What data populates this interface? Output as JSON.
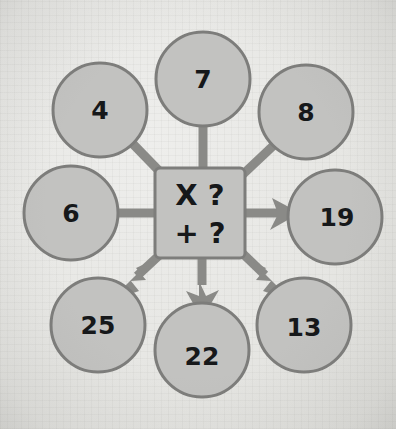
{
  "figure": {
    "background_color": "#e7e7e4",
    "node_fill": "#c2c2c0",
    "node_stroke": "#7d7d7b",
    "connector_color": "#8a8a87",
    "text_color": "#16181a"
  },
  "center": {
    "name": "operation-box",
    "shape": "rounded-square",
    "line1": "X ?",
    "line2": "+ ?",
    "operator_multiply": "X",
    "operator_add": "+",
    "unknown_1": "?",
    "unknown_2": "?",
    "cx": 200,
    "cy": 213,
    "size": 90
  },
  "nodes": [
    {
      "id": "input-top-left",
      "label": "4",
      "cx": 100,
      "cy": 110,
      "r": 47,
      "role": "input",
      "arrow": false
    },
    {
      "id": "input-top",
      "label": "7",
      "cx": 203,
      "cy": 79,
      "r": 47,
      "role": "input",
      "arrow": false
    },
    {
      "id": "input-top-right",
      "label": "8",
      "cx": 306,
      "cy": 112,
      "r": 47,
      "role": "input",
      "arrow": false
    },
    {
      "id": "input-left",
      "label": "6",
      "cx": 71,
      "cy": 213,
      "r": 47,
      "role": "input",
      "arrow": false
    },
    {
      "id": "output-right",
      "label": "19",
      "cx": 335,
      "cy": 217,
      "r": 47,
      "role": "output",
      "arrow": true
    },
    {
      "id": "output-bottom-left",
      "label": "25",
      "cx": 98,
      "cy": 325,
      "r": 47,
      "role": "output",
      "arrow": true
    },
    {
      "id": "output-bottom",
      "label": "22",
      "cx": 202,
      "cy": 350,
      "r": 47,
      "role": "output",
      "arrow": true
    },
    {
      "id": "output-bottom-right",
      "label": "13",
      "cx": 304,
      "cy": 325,
      "r": 47,
      "role": "output",
      "arrow": true
    }
  ],
  "connectors": [
    {
      "from": "input-top-left",
      "to": "operation-box",
      "arrowhead": false,
      "direction": "into-center"
    },
    {
      "from": "input-top",
      "to": "operation-box",
      "arrowhead": false,
      "direction": "into-center"
    },
    {
      "from": "input-top-right",
      "to": "operation-box",
      "arrowhead": false,
      "direction": "into-center"
    },
    {
      "from": "input-left",
      "to": "operation-box",
      "arrowhead": false,
      "direction": "into-center"
    },
    {
      "from": "operation-box",
      "to": "output-right",
      "arrowhead": true,
      "direction": "out-right"
    },
    {
      "from": "operation-box",
      "to": "output-bottom-left",
      "arrowhead": true,
      "direction": "out-down-left"
    },
    {
      "from": "operation-box",
      "to": "output-bottom",
      "arrowhead": true,
      "direction": "out-down"
    },
    {
      "from": "operation-box",
      "to": "output-bottom-right",
      "arrowhead": true,
      "direction": "out-down-right"
    }
  ]
}
